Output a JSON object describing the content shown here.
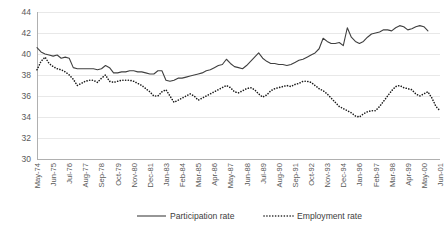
{
  "chart_data": {
    "type": "line",
    "title": "",
    "xlabel": "",
    "ylabel": "",
    "ylim": [
      30,
      44
    ],
    "yticks": [
      30,
      32,
      34,
      36,
      38,
      40,
      42,
      44
    ],
    "grid": true,
    "legend_position": "bottom",
    "legend": [
      "Participation rate",
      "Employment rate"
    ],
    "xtick_labels": [
      "May-74",
      "Jun-75",
      "Jul-76",
      "Aug-77",
      "Sep-78",
      "Oct-79",
      "Nov-80",
      "Dec-81",
      "Jan-83",
      "Feb-84",
      "Mar-85",
      "Apr-86",
      "May-87",
      "Jun-88",
      "Jul-89",
      "Aug-90",
      "Sep-91",
      "Oct-92",
      "Nov-93",
      "Dec-94",
      "Jan-96",
      "Feb-97",
      "Mar-98",
      "Apr-99",
      "May-00",
      "Jun-01"
    ],
    "xtick_interval_points": 4,
    "colors": {
      "participation": "#404040",
      "employment": "#1a1a1a",
      "gridline": "#e8e8e8",
      "axis": "#b0b0b0",
      "text": "#595959"
    },
    "series": [
      {
        "name": "Participation rate",
        "style": "solid",
        "values": [
          40.6,
          40.2,
          40.0,
          39.9,
          39.8,
          39.9,
          39.6,
          39.7,
          39.6,
          38.7,
          38.6,
          38.6,
          38.6,
          38.6,
          38.6,
          38.5,
          38.6,
          38.9,
          38.7,
          38.2,
          38.2,
          38.3,
          38.3,
          38.4,
          38.4,
          38.3,
          38.3,
          38.2,
          38.1,
          38.1,
          38.4,
          38.4,
          37.5,
          37.4,
          37.5,
          37.7,
          37.7,
          37.8,
          37.9,
          38.0,
          38.1,
          38.2,
          38.4,
          38.5,
          38.7,
          38.9,
          39.0,
          39.5,
          39.1,
          38.8,
          38.7,
          38.6,
          38.9,
          39.3,
          39.7,
          40.1,
          39.6,
          39.3,
          39.1,
          39.1,
          39.0,
          39.0,
          38.9,
          39.0,
          39.2,
          39.4,
          39.5,
          39.7,
          39.9,
          40.1,
          40.5,
          41.5,
          41.2,
          41.0,
          41.0,
          41.1,
          40.8,
          42.5,
          41.6,
          41.2,
          41.0,
          41.2,
          41.6,
          41.9,
          42.0,
          42.1,
          42.3,
          42.3,
          42.2,
          42.5,
          42.7,
          42.6,
          42.3,
          42.4,
          42.6,
          42.7,
          42.6,
          42.2
        ]
      },
      {
        "name": "Employment rate",
        "style": "dotted",
        "values": [
          38.5,
          39.3,
          39.7,
          39.1,
          38.8,
          38.6,
          38.5,
          38.3,
          38.0,
          37.6,
          37.0,
          37.2,
          37.4,
          37.5,
          37.5,
          37.3,
          37.7,
          38.0,
          37.4,
          37.3,
          37.4,
          37.5,
          37.5,
          37.5,
          37.4,
          37.2,
          37.0,
          36.7,
          36.4,
          36.0,
          36.0,
          36.4,
          36.6,
          36.0,
          35.4,
          35.6,
          35.8,
          36.0,
          36.2,
          36.0,
          35.6,
          35.8,
          36.0,
          36.2,
          36.4,
          36.6,
          36.8,
          37.0,
          36.8,
          36.4,
          36.3,
          36.5,
          36.7,
          36.8,
          36.6,
          36.2,
          35.9,
          36.1,
          36.5,
          36.7,
          36.8,
          36.9,
          37.0,
          36.9,
          37.1,
          37.2,
          37.4,
          37.4,
          37.3,
          37.0,
          36.7,
          36.5,
          36.2,
          35.8,
          35.4,
          35.0,
          34.8,
          34.6,
          34.4,
          34.1,
          34.0,
          34.3,
          34.5,
          34.6,
          34.6,
          35.0,
          35.5,
          36.0,
          36.5,
          36.9,
          37.0,
          36.8,
          36.7,
          36.6,
          36.2,
          36.0,
          36.2,
          36.4,
          35.8,
          35.0,
          34.6
        ]
      }
    ]
  }
}
